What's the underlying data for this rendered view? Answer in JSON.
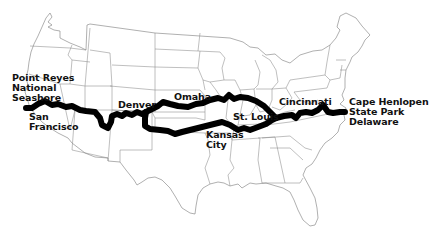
{
  "map": {
    "title": "US cross-country route map",
    "route_color": "#000000",
    "state_line_color": "#7a7a7a",
    "background": "#ffffff",
    "labels": [
      {
        "id": "point-reyes",
        "text": "Point Reyes\nNational\nSeashore",
        "x": 12,
        "y": 73
      },
      {
        "id": "san-francisco",
        "text": "San\nFrancisco",
        "x": 29,
        "y": 112
      },
      {
        "id": "denver",
        "text": "Denver",
        "x": 118,
        "y": 100
      },
      {
        "id": "omaha",
        "text": "Omaha",
        "x": 174,
        "y": 92
      },
      {
        "id": "st-louis",
        "text": "St. Louis",
        "x": 233,
        "y": 112
      },
      {
        "id": "kansas-city",
        "text": "Kansas\nCity",
        "x": 206,
        "y": 130
      },
      {
        "id": "cincinnati",
        "text": "Cincinnati",
        "x": 279,
        "y": 97
      },
      {
        "id": "cape-henlopen",
        "text": "Cape Henlopen\nState Park\nDelaware",
        "x": 349,
        "y": 97
      }
    ]
  }
}
